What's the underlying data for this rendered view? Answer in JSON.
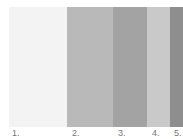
{
  "chart_data": {
    "type": "bar",
    "orientation": "stacked-horizontal-bands",
    "title": "",
    "xlabel": "",
    "ylabel": "",
    "categories": [
      "1.",
      "2.",
      "3.",
      "4.",
      "5."
    ],
    "values": [
      58,
      46,
      34,
      23,
      13
    ],
    "colors": [
      "#f3f3f3",
      "#b9b9b9",
      "#a3a3a3",
      "#c9c9c9",
      "#8e8e8e"
    ],
    "grid": false,
    "legend": "none"
  },
  "bands": [
    {
      "label": "1.",
      "left": 9,
      "width": 58,
      "color": "#f3f3f3",
      "label_x": 12
    },
    {
      "label": "2.",
      "left": 67,
      "width": 46,
      "color": "#b9b9b9",
      "label_x": 72
    },
    {
      "label": "3.",
      "left": 113,
      "width": 34,
      "color": "#a3a3a3",
      "label_x": 118
    },
    {
      "label": "4.",
      "left": 147,
      "width": 23,
      "color": "#c9c9c9",
      "label_x": 152
    },
    {
      "label": "5.",
      "left": 170,
      "width": 13,
      "color": "#8e8e8e",
      "label_x": 174
    }
  ]
}
